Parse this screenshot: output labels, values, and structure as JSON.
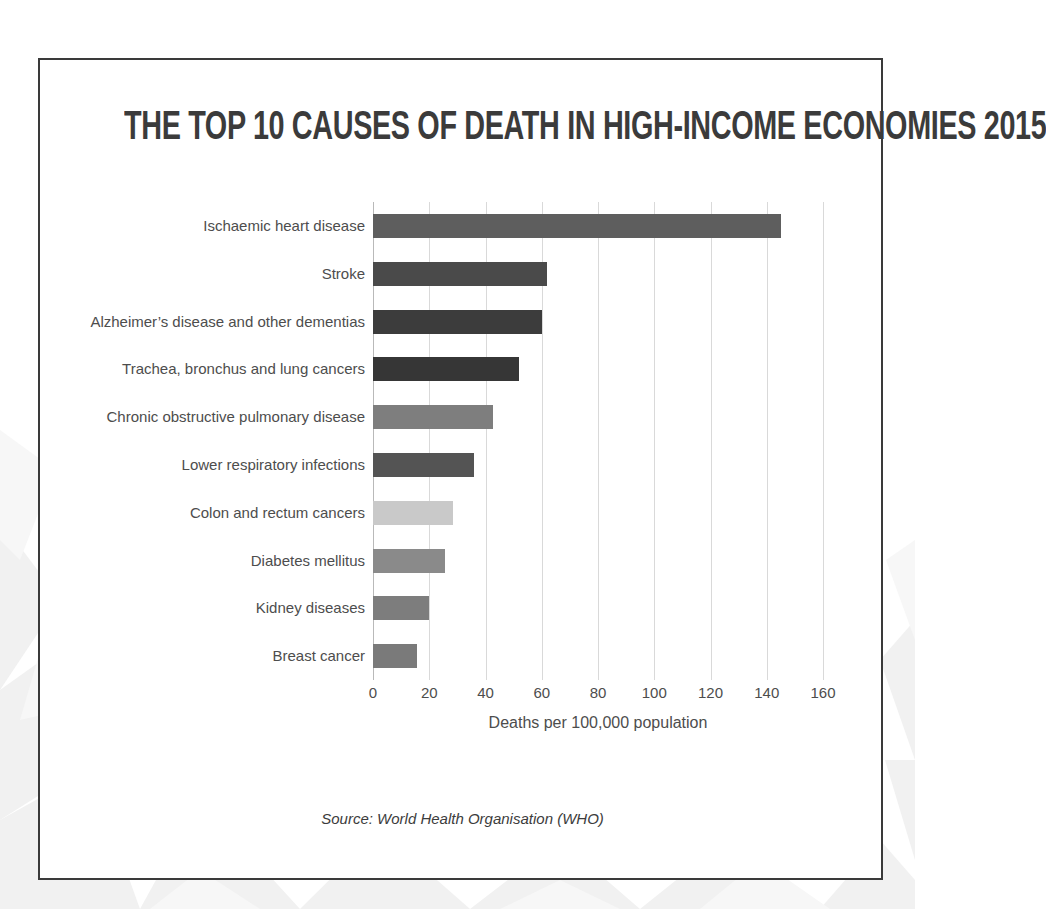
{
  "poster": {
    "title": "THE TOP 10 CAUSES OF DEATH IN HIGH-INCOME ECONOMIES 2015",
    "source_note": "Source: World Health Organisation (WHO)",
    "frame_color": "#3a3a3a",
    "background_color": "#ffffff"
  },
  "chart_data": {
    "type": "bar",
    "orientation": "horizontal",
    "title": "THE TOP 10 CAUSES OF DEATH IN HIGH-INCOME ECONOMIES 2015",
    "xlabel": "Deaths per 100,000  population",
    "ylabel": "",
    "xlim": [
      0,
      160
    ],
    "xticks": [
      0,
      20,
      40,
      60,
      80,
      100,
      120,
      140,
      160
    ],
    "grid": "vertical",
    "legend": "none",
    "categories": [
      "Ischaemic heart disease",
      "Stroke",
      "Alzheimer’s disease and other dementias",
      "Trachea, bronchus and lung cancers",
      "Chronic obstructive pulmonary disease",
      "Lower respiratory infections",
      "Colon and rectum cancers",
      "Diabetes mellitus",
      "Kidney diseases",
      "Breast cancer"
    ],
    "values": [
      145,
      62,
      60,
      52,
      42.5,
      36,
      28.5,
      25.5,
      20,
      15.5
    ],
    "bar_colors": [
      "#5e5e5e",
      "#4a4a4a",
      "#3c3c3c",
      "#363636",
      "#7e7e7e",
      "#545454",
      "#c9c9c9",
      "#8a8a8a",
      "#7d7d7d",
      "#7a7a7a"
    ],
    "gridline_color": "#d9d9d9",
    "axis_text_color": "#4d4d4d"
  }
}
